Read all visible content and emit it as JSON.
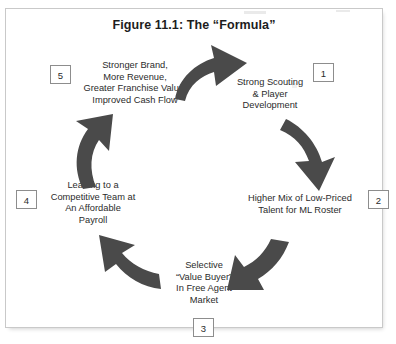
{
  "figure": {
    "title": "Figure 11.1: The “Formula”",
    "type": "cycle-diagram",
    "node_count": 5,
    "direction": "clockwise",
    "arrow_color": "#4a4a4a",
    "border_color": "#c9c9c9"
  },
  "nodes": [
    {
      "number": "1",
      "label": "Strong Scouting\n& Player\nDevelopment",
      "box_side": "right"
    },
    {
      "number": "2",
      "label": "Higher Mix of Low-Priced\nTalent for ML Roster",
      "box_side": "right"
    },
    {
      "number": "3",
      "label": "Selective\n“Value Buyer”\nIn Free Agent\nMarket",
      "box_side": "below"
    },
    {
      "number": "4",
      "label": "Leading to a\nCompetitive Team at\nAn Affordable\nPayroll",
      "box_side": "left"
    },
    {
      "number": "5",
      "label": "Stronger Brand,\nMore Revenue,\nGreater Franchise Value,\nImproved Cash Flow",
      "box_side": "left"
    }
  ],
  "arrows": [
    {
      "name": "arrow-5-to-1",
      "from": "5",
      "to": "1",
      "points": "right-down"
    },
    {
      "name": "arrow-1-to-2",
      "from": "1",
      "to": "2",
      "points": "down-left"
    },
    {
      "name": "arrow-2-to-3",
      "from": "2",
      "to": "3",
      "points": "down-left"
    },
    {
      "name": "arrow-3-to-4",
      "from": "3",
      "to": "4",
      "points": "up-left"
    },
    {
      "name": "arrow-4-to-5",
      "from": "4",
      "to": "5",
      "points": "up-right"
    }
  ]
}
